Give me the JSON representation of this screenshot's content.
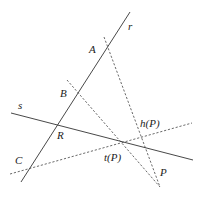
{
  "diagram": {
    "lines": {
      "r": {
        "label": "r",
        "style": "solid",
        "from": [
          21,
          182
        ],
        "to": [
          130,
          12
        ],
        "label_pos": [
          128,
          30
        ]
      },
      "s": {
        "label": "s",
        "style": "solid",
        "from": [
          11,
          113
        ],
        "to": [
          193,
          160
        ],
        "label_pos": [
          18,
          109
        ]
      },
      "through_A": {
        "style": "dashed",
        "from": [
          104,
          37
        ],
        "to": [
          160,
          187
        ]
      },
      "through_B": {
        "style": "dashed",
        "from": [
          67,
          80
        ],
        "to": [
          160,
          187
        ]
      },
      "through_C": {
        "style": "dashed",
        "from": [
          10,
          174
        ],
        "to": [
          192,
          123
        ]
      }
    },
    "points": [
      {
        "name": "A",
        "label": "A",
        "pos": [
          107,
          47
        ],
        "label_pos": [
          89,
          53
        ]
      },
      {
        "name": "B",
        "label": "B",
        "pos": [
          78,
          93
        ],
        "label_pos": [
          60,
          97
        ]
      },
      {
        "name": "R",
        "label": "R",
        "pos": [
          58,
          124
        ],
        "label_pos": [
          57,
          139
        ]
      },
      {
        "name": "C",
        "label": "C",
        "pos": [
          30,
          168
        ],
        "label_pos": [
          15,
          164
        ]
      },
      {
        "name": "t(P)",
        "label": "t(P)",
        "pos": [
          123,
          142
        ],
        "label_pos": [
          104,
          161
        ]
      },
      {
        "name": "h(P)",
        "label": "h(P)",
        "pos": [
          142,
          138
        ],
        "label_pos": [
          140,
          127
        ]
      },
      {
        "name": "P",
        "label": "P",
        "pos": [
          157,
          180
        ],
        "label_pos": [
          160,
          176
        ]
      }
    ]
  }
}
